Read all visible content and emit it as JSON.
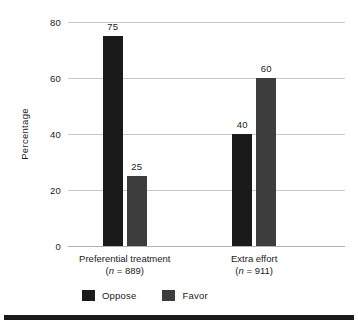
{
  "chart_data": {
    "type": "bar",
    "title": "",
    "subtitle": "",
    "xlabel": "",
    "ylabel": "Percentage",
    "ylim": [
      0,
      80
    ],
    "yticks": [
      0,
      20,
      40,
      60,
      80
    ],
    "ytick_labels": [
      "0",
      "20",
      "40",
      "60",
      "80"
    ],
    "grid": true,
    "legend_position": "bottom-left",
    "categories": [
      "Preferential treatment",
      "Extra effort"
    ],
    "category_notes": [
      "(n = 889)",
      "(n = 911)"
    ],
    "category_n_prefix": "(",
    "category_n_italic": "n",
    "category_n_values": [
      "= 889)",
      "= 911)"
    ],
    "series": [
      {
        "name": "Oppose",
        "color": "#1a1a1a",
        "values": [
          75,
          40
        ],
        "value_labels": [
          "75",
          "40"
        ]
      },
      {
        "name": "Favor",
        "color": "#3d3d3d",
        "values": [
          25,
          60
        ],
        "value_labels": [
          "25",
          "60"
        ]
      }
    ]
  },
  "legend": {
    "items": [
      {
        "label": "Oppose",
        "swatch": "legend-swatch-oppose"
      },
      {
        "label": "Favor",
        "swatch": "legend-swatch-favor"
      }
    ]
  },
  "colors": {
    "oppose": "#1a1a1a",
    "favor": "#3d3d3d",
    "gridline": "#c8c8c8",
    "baseline": "#b0b0b0",
    "text": "#1a1a1a",
    "background": "#ffffff",
    "rule": "#1a1a1a"
  }
}
